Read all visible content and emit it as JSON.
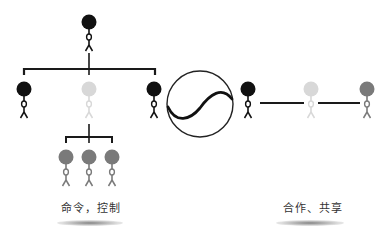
{
  "diagram": {
    "left": {
      "label": "命令，控制",
      "concept": "hierarchy"
    },
    "center": {
      "symbol": "circle-with-s-curve"
    },
    "right": {
      "label": "合作、共享",
      "concept": "collaboration"
    }
  },
  "colors": {
    "dark": "#111111",
    "light": "#d6d6d6",
    "mid": "#7a7a7a",
    "line": "#1a1a1a"
  }
}
